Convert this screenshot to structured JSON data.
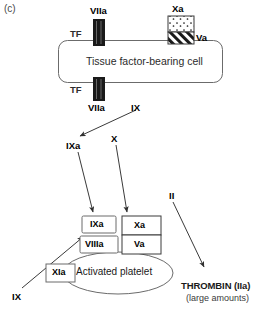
{
  "figure": {
    "panel_label": "(c)",
    "title_cell": "Tissue factor-bearing cell"
  },
  "top_complex": {
    "viia_label": "VIIa",
    "tf_label": "TF",
    "xa_label": "Xa",
    "va_label": "Va"
  },
  "bottom_complex": {
    "tf_label": "TF",
    "viia_label": "VIIa"
  },
  "factors": {
    "ix_top": "IX",
    "ixa_mid": "IXa",
    "x_mid": "X",
    "ii_mid": "II",
    "ix_bottom": "IX"
  },
  "platelet_complex": {
    "ixa": "IXa",
    "viiia": "VIIIa",
    "xa": "Xa",
    "va": "Va",
    "xia": "XIa",
    "platelet_label": "Activated platelet"
  },
  "output": {
    "thrombin": "THROMBIN (IIa)",
    "amount": "(large amounts)"
  },
  "colors": {
    "stroke": "#4d4d4d",
    "arrow": "#3a3a3a",
    "fill_black": "#1a1a1a",
    "text": "#1a1a1a"
  }
}
